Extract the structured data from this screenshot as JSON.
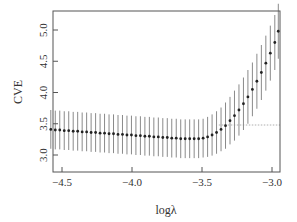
{
  "chart_data": {
    "type": "scatter",
    "subtype": "error-bar",
    "title": "",
    "xlabel": "logλ",
    "ylabel": "CVE",
    "xlim": [
      -4.6,
      -2.94
    ],
    "ylim": [
      2.75,
      5.3
    ],
    "xticks": [
      -4.5,
      -4.0,
      -3.5,
      -3.0
    ],
    "xtick_labels": [
      "−4.5",
      "−4.0",
      "−3.5",
      "−3.0"
    ],
    "yticks": [
      3.0,
      3.5,
      4.0,
      4.5,
      5.0
    ],
    "ytick_labels": [
      "3.0",
      "3.5",
      "4.0",
      "4.5",
      "5.0"
    ],
    "grid": false,
    "legend": null,
    "reference_line": {
      "y": 3.48,
      "x_from": -3.38,
      "x_to": -2.94,
      "style": "dotted"
    },
    "series": [
      {
        "name": "CVE",
        "x": [
          -4.58,
          -4.548,
          -4.516,
          -4.484,
          -4.452,
          -4.42,
          -4.388,
          -4.356,
          -4.324,
          -4.292,
          -4.26,
          -4.228,
          -4.196,
          -4.164,
          -4.132,
          -4.1,
          -4.068,
          -4.036,
          -4.004,
          -3.972,
          -3.94,
          -3.908,
          -3.876,
          -3.844,
          -3.812,
          -3.78,
          -3.748,
          -3.716,
          -3.684,
          -3.652,
          -3.62,
          -3.588,
          -3.556,
          -3.524,
          -3.492,
          -3.46,
          -3.428,
          -3.396,
          -3.364,
          -3.332,
          -3.3,
          -3.268,
          -3.236,
          -3.204,
          -3.172,
          -3.14,
          -3.108,
          -3.076,
          -3.044,
          -3.012,
          -2.98,
          -2.955
        ],
        "y": [
          3.41,
          3.4,
          3.4,
          3.39,
          3.39,
          3.38,
          3.38,
          3.37,
          3.37,
          3.36,
          3.36,
          3.35,
          3.35,
          3.34,
          3.34,
          3.33,
          3.33,
          3.32,
          3.32,
          3.31,
          3.31,
          3.3,
          3.3,
          3.29,
          3.29,
          3.28,
          3.28,
          3.27,
          3.27,
          3.26,
          3.26,
          3.26,
          3.26,
          3.26,
          3.27,
          3.29,
          3.32,
          3.36,
          3.41,
          3.47,
          3.55,
          3.63,
          3.72,
          3.82,
          3.93,
          4.05,
          4.18,
          4.32,
          4.47,
          4.63,
          4.8,
          4.98
        ],
        "err": [
          0.31,
          0.31,
          0.31,
          0.31,
          0.31,
          0.31,
          0.31,
          0.31,
          0.31,
          0.31,
          0.31,
          0.31,
          0.31,
          0.31,
          0.31,
          0.31,
          0.31,
          0.31,
          0.31,
          0.31,
          0.31,
          0.31,
          0.31,
          0.31,
          0.31,
          0.31,
          0.31,
          0.31,
          0.31,
          0.31,
          0.31,
          0.31,
          0.31,
          0.31,
          0.31,
          0.32,
          0.33,
          0.34,
          0.35,
          0.37,
          0.38,
          0.4,
          0.41,
          0.42,
          0.43,
          0.43,
          0.44,
          0.44,
          0.44,
          0.44,
          0.44,
          0.44
        ]
      }
    ]
  }
}
